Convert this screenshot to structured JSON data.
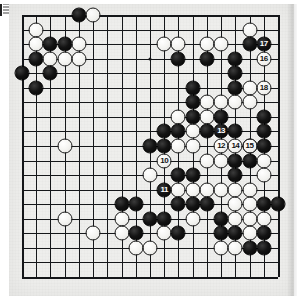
{
  "document": {
    "type": "go-game-diagram",
    "corner_icon": "bookmark-icon",
    "paper_color": "#eeeeec",
    "line_color": "#15171a",
    "black_stone_color": "#0c0c0c",
    "white_stone_color": "#f5f4f1"
  },
  "board": {
    "size": 19,
    "label": "Go board 19x19",
    "star_points": [
      {
        "col": 10,
        "row": 4
      },
      {
        "col": 4,
        "row": 10
      }
    ],
    "stones": [
      {
        "col": 2,
        "row": 2,
        "color": "white"
      },
      {
        "col": 5,
        "row": 1,
        "color": "black"
      },
      {
        "col": 6,
        "row": 1,
        "color": "white"
      },
      {
        "col": 2,
        "row": 3,
        "color": "white"
      },
      {
        "col": 3,
        "row": 3,
        "color": "black"
      },
      {
        "col": 4,
        "row": 3,
        "color": "black"
      },
      {
        "col": 5,
        "row": 3,
        "color": "white"
      },
      {
        "col": 2,
        "row": 4,
        "color": "black"
      },
      {
        "col": 3,
        "row": 4,
        "color": "white"
      },
      {
        "col": 4,
        "row": 4,
        "color": "white"
      },
      {
        "col": 5,
        "row": 4,
        "color": "white"
      },
      {
        "col": 1,
        "row": 5,
        "color": "black"
      },
      {
        "col": 3,
        "row": 5,
        "color": "black"
      },
      {
        "col": 2,
        "row": 6,
        "color": "black"
      },
      {
        "col": 11,
        "row": 3,
        "color": "white"
      },
      {
        "col": 12,
        "row": 3,
        "color": "white"
      },
      {
        "col": 14,
        "row": 3,
        "color": "white"
      },
      {
        "col": 15,
        "row": 3,
        "color": "white"
      },
      {
        "col": 17,
        "row": 2,
        "color": "white"
      },
      {
        "col": 17,
        "row": 3,
        "color": "black"
      },
      {
        "col": 12,
        "row": 4,
        "color": "black"
      },
      {
        "col": 14,
        "row": 4,
        "color": "black"
      },
      {
        "col": 16,
        "row": 4,
        "color": "black"
      },
      {
        "col": 16,
        "row": 5,
        "color": "black"
      },
      {
        "col": 13,
        "row": 6,
        "color": "black"
      },
      {
        "col": 16,
        "row": 6,
        "color": "black"
      },
      {
        "col": 17,
        "row": 6,
        "color": "white"
      },
      {
        "col": 13,
        "row": 7,
        "color": "black"
      },
      {
        "col": 14,
        "row": 7,
        "color": "white"
      },
      {
        "col": 15,
        "row": 7,
        "color": "white"
      },
      {
        "col": 16,
        "row": 7,
        "color": "white"
      },
      {
        "col": 17,
        "row": 7,
        "color": "white"
      },
      {
        "col": 12,
        "row": 8,
        "color": "white"
      },
      {
        "col": 13,
        "row": 8,
        "color": "black"
      },
      {
        "col": 14,
        "row": 8,
        "color": "white"
      },
      {
        "col": 15,
        "row": 8,
        "color": "black"
      },
      {
        "col": 18,
        "row": 8,
        "color": "black"
      },
      {
        "col": 11,
        "row": 9,
        "color": "black"
      },
      {
        "col": 12,
        "row": 9,
        "color": "black"
      },
      {
        "col": 13,
        "row": 9,
        "color": "white"
      },
      {
        "col": 14,
        "row": 9,
        "color": "black"
      },
      {
        "col": 16,
        "row": 9,
        "color": "black"
      },
      {
        "col": 18,
        "row": 9,
        "color": "black"
      },
      {
        "col": 10,
        "row": 10,
        "color": "black"
      },
      {
        "col": 11,
        "row": 10,
        "color": "black"
      },
      {
        "col": 12,
        "row": 10,
        "color": "white"
      },
      {
        "col": 13,
        "row": 10,
        "color": "white"
      },
      {
        "col": 17,
        "row": 10,
        "color": "black"
      },
      {
        "col": 18,
        "row": 10,
        "color": "black"
      },
      {
        "col": 4,
        "row": 10,
        "color": "white"
      },
      {
        "col": 14,
        "row": 11,
        "color": "white"
      },
      {
        "col": 15,
        "row": 11,
        "color": "white"
      },
      {
        "col": 16,
        "row": 11,
        "color": "black"
      },
      {
        "col": 17,
        "row": 11,
        "color": "black"
      },
      {
        "col": 18,
        "row": 11,
        "color": "white"
      },
      {
        "col": 10,
        "row": 12,
        "color": "white"
      },
      {
        "col": 12,
        "row": 12,
        "color": "black"
      },
      {
        "col": 13,
        "row": 12,
        "color": "black"
      },
      {
        "col": 16,
        "row": 12,
        "color": "black"
      },
      {
        "col": 18,
        "row": 12,
        "color": "white"
      },
      {
        "col": 12,
        "row": 13,
        "color": "white"
      },
      {
        "col": 13,
        "row": 13,
        "color": "white"
      },
      {
        "col": 14,
        "row": 13,
        "color": "white"
      },
      {
        "col": 15,
        "row": 13,
        "color": "white"
      },
      {
        "col": 16,
        "row": 13,
        "color": "white"
      },
      {
        "col": 17,
        "row": 13,
        "color": "white"
      },
      {
        "col": 12,
        "row": 14,
        "color": "black"
      },
      {
        "col": 13,
        "row": 14,
        "color": "black"
      },
      {
        "col": 14,
        "row": 14,
        "color": "black"
      },
      {
        "col": 16,
        "row": 14,
        "color": "white"
      },
      {
        "col": 17,
        "row": 14,
        "color": "white"
      },
      {
        "col": 18,
        "row": 14,
        "color": "black"
      },
      {
        "col": 19,
        "row": 14,
        "color": "black"
      },
      {
        "col": 8,
        "row": 14,
        "color": "black"
      },
      {
        "col": 9,
        "row": 14,
        "color": "black"
      },
      {
        "col": 13,
        "row": 15,
        "color": "white"
      },
      {
        "col": 15,
        "row": 15,
        "color": "black"
      },
      {
        "col": 16,
        "row": 15,
        "color": "white"
      },
      {
        "col": 17,
        "row": 15,
        "color": "white"
      },
      {
        "col": 18,
        "row": 15,
        "color": "white"
      },
      {
        "col": 4,
        "row": 15,
        "color": "white"
      },
      {
        "col": 8,
        "row": 15,
        "color": "white"
      },
      {
        "col": 10,
        "row": 15,
        "color": "black"
      },
      {
        "col": 11,
        "row": 15,
        "color": "black"
      },
      {
        "col": 6,
        "row": 16,
        "color": "white"
      },
      {
        "col": 8,
        "row": 16,
        "color": "white"
      },
      {
        "col": 9,
        "row": 16,
        "color": "black"
      },
      {
        "col": 11,
        "row": 16,
        "color": "white"
      },
      {
        "col": 12,
        "row": 16,
        "color": "black"
      },
      {
        "col": 15,
        "row": 16,
        "color": "black"
      },
      {
        "col": 16,
        "row": 16,
        "color": "black"
      },
      {
        "col": 17,
        "row": 16,
        "color": "white"
      },
      {
        "col": 18,
        "row": 16,
        "color": "black"
      },
      {
        "col": 9,
        "row": 17,
        "color": "white"
      },
      {
        "col": 10,
        "row": 17,
        "color": "white"
      },
      {
        "col": 15,
        "row": 17,
        "color": "white"
      },
      {
        "col": 16,
        "row": 17,
        "color": "white"
      },
      {
        "col": 17,
        "row": 17,
        "color": "black"
      },
      {
        "col": 18,
        "row": 17,
        "color": "black"
      }
    ],
    "numbered_moves": [
      {
        "col": 11,
        "row": 11,
        "number": "10",
        "color": "white"
      },
      {
        "col": 11,
        "row": 13,
        "number": "11",
        "color": "black"
      },
      {
        "col": 15,
        "row": 10,
        "number": "12",
        "color": "white"
      },
      {
        "col": 15,
        "row": 9,
        "number": "13",
        "color": "black"
      },
      {
        "col": 16,
        "row": 10,
        "number": "14",
        "color": "white"
      },
      {
        "col": 17,
        "row": 10,
        "number": "15",
        "color": "white"
      },
      {
        "col": 18,
        "row": 4,
        "number": "16",
        "color": "white"
      },
      {
        "col": 18,
        "row": 3,
        "number": "17",
        "color": "black"
      },
      {
        "col": 18,
        "row": 6,
        "number": "18",
        "color": "white"
      }
    ]
  }
}
